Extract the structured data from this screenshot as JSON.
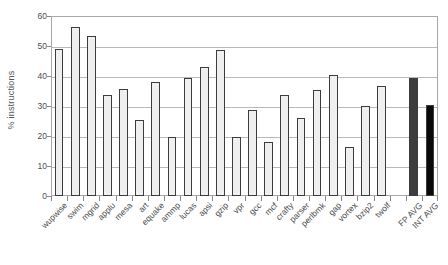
{
  "chart_data": {
    "type": "bar",
    "title": "",
    "xlabel": "",
    "ylabel": "% instructions",
    "ylim": [
      0,
      60
    ],
    "ytick_values": [
      0,
      10,
      20,
      30,
      40,
      50,
      60
    ],
    "ytick_labels": [
      "0",
      "10",
      "20",
      "30",
      "40",
      "50",
      "60"
    ],
    "grid": true,
    "legend": "none",
    "categories": [
      "wupwise",
      "swim",
      "mgrid",
      "applu",
      "mesa",
      "art",
      "equake",
      "ammp",
      "lucas",
      "apsi",
      "gzip",
      "vpr",
      "gcc",
      "mcf",
      "crafty",
      "parser",
      "perlbmk",
      "gap",
      "vortex",
      "bzip2",
      "twolf",
      "FP AVG",
      "INT AVG"
    ],
    "values": [
      49.0,
      56.5,
      53.5,
      33.7,
      35.6,
      25.3,
      38.0,
      19.8,
      39.5,
      43.0,
      48.6,
      19.8,
      28.6,
      18.1,
      33.6,
      26.0,
      35.2,
      40.3,
      16.5,
      29.9,
      36.7,
      39.4,
      30.2
    ],
    "bar_styles": [
      "light",
      "light",
      "light",
      "light",
      "light",
      "light",
      "light",
      "light",
      "light",
      "light",
      "light",
      "light",
      "light",
      "light",
      "light",
      "light",
      "light",
      "light",
      "light",
      "light",
      "light",
      "dark",
      "black"
    ],
    "gap_before_index": 21,
    "colors": {
      "bar_light_fill": "#efefef",
      "bar_dark_fill": "#3d3d3d",
      "bar_black_fill": "#0a0a0a",
      "bar_border": "#3c3c3c",
      "gridline": "#b9b9b9",
      "axis": "#a8a8a8",
      "text": "#4b4b4b",
      "background": "#ffffff"
    }
  }
}
